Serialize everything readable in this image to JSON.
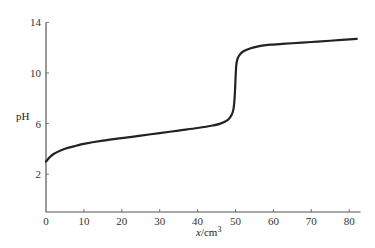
{
  "chart_data": {
    "type": "line",
    "title": "",
    "xlabel": "x/cm",
    "xlabel_italic_part": "x",
    "xlabel_unit": "/cm",
    "xlabel_superscript": "3",
    "ylabel": "pH",
    "xlim": [
      0,
      83
    ],
    "ylim": [
      -0.9,
      14
    ],
    "x_ticks": [
      0,
      10,
      20,
      30,
      40,
      50,
      60,
      70,
      80
    ],
    "y_ticks": [
      2,
      6,
      10,
      14
    ],
    "grid": false,
    "legend": null,
    "series": [
      {
        "name": "titration curve",
        "color": "#222222",
        "x": [
          0,
          1,
          2,
          4,
          6,
          8,
          10,
          15,
          20,
          25,
          30,
          35,
          40,
          44,
          46,
          48,
          49,
          49.5,
          49.8,
          50,
          50.2,
          50.5,
          51,
          52,
          54,
          56,
          58,
          60,
          65,
          70,
          75,
          82
        ],
        "y": [
          3.0,
          3.35,
          3.6,
          3.9,
          4.1,
          4.25,
          4.4,
          4.65,
          4.85,
          5.05,
          5.25,
          5.45,
          5.65,
          5.85,
          6.0,
          6.3,
          6.7,
          7.2,
          8.2,
          9.5,
          10.6,
          11.1,
          11.4,
          11.7,
          11.95,
          12.1,
          12.2,
          12.25,
          12.35,
          12.45,
          12.55,
          12.7
        ]
      }
    ]
  },
  "labels": {
    "y_axis": "pH",
    "x_axis_italic": "x",
    "x_axis_unit": "/cm",
    "x_axis_sup": "3"
  }
}
